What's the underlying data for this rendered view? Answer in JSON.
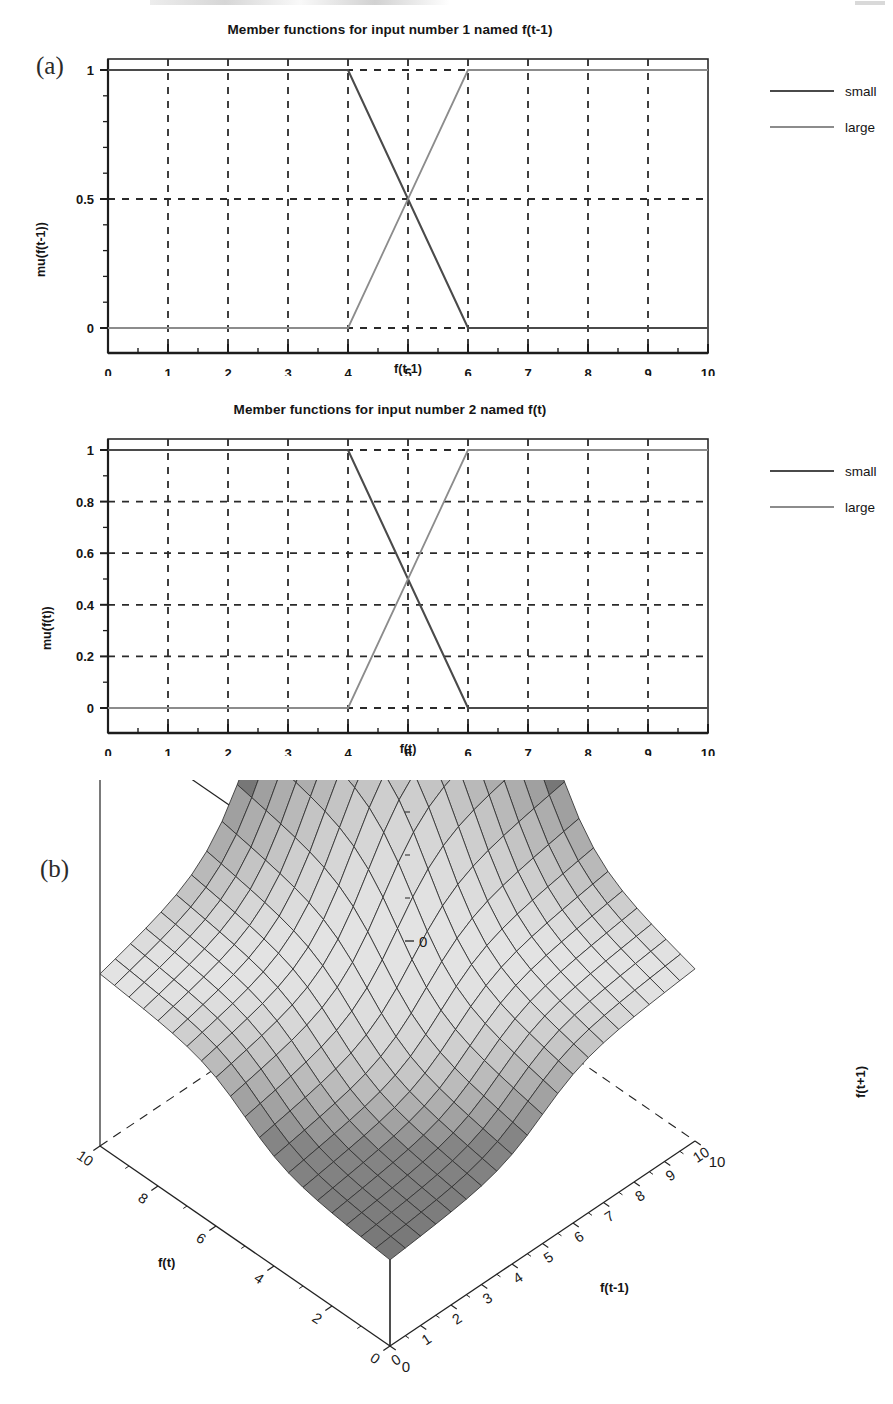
{
  "figure": {
    "panel_a_letter": "(a)",
    "panel_b_letter": "(b)"
  },
  "chart_data": [
    {
      "type": "line",
      "panel": "(a)",
      "title": "Member functions for input number 1 named f(t-1)",
      "xlabel": "f(t-1)",
      "ylabel": "mu(f(t-1))",
      "xlim": [
        0,
        10
      ],
      "ylim": [
        0,
        1
      ],
      "xticks": [
        "0",
        "1",
        "2",
        "3",
        "4",
        "5",
        "6",
        "7",
        "8",
        "9",
        "10"
      ],
      "yticks": [
        "0",
        "0.5",
        "1"
      ],
      "grid": true,
      "grid_style": "dashed",
      "legend_position": "right-outside",
      "series": [
        {
          "name": "small",
          "color": "#4a4a4a",
          "x": [
            0,
            4,
            6,
            10
          ],
          "y": [
            1,
            1,
            0,
            0
          ]
        },
        {
          "name": "large",
          "color": "#8c8c8c",
          "x": [
            0,
            4,
            6,
            10
          ],
          "y": [
            0,
            0,
            1,
            1
          ]
        }
      ],
      "crossing_point": {
        "x": 5,
        "y": 0.5
      }
    },
    {
      "type": "line",
      "panel": "(a)",
      "title": "Member functions for input number 2 named f(t)",
      "xlabel": "f(t)",
      "ylabel": "mu(f(t))",
      "xlim": [
        0,
        10
      ],
      "ylim": [
        0,
        1
      ],
      "xticks": [
        "0",
        "1",
        "2",
        "3",
        "4",
        "5",
        "6",
        "7",
        "8",
        "9",
        "10"
      ],
      "yticks": [
        "0",
        "0.2",
        "0.4",
        "0.6",
        "0.8",
        "1"
      ],
      "grid": true,
      "grid_style": "dashed",
      "legend_position": "right-outside",
      "series": [
        {
          "name": "small",
          "color": "#4a4a4a",
          "x": [
            0,
            4,
            6,
            10
          ],
          "y": [
            1,
            1,
            0,
            0
          ]
        },
        {
          "name": "large",
          "color": "#8c8c8c",
          "x": [
            0,
            4,
            6,
            10
          ],
          "y": [
            0,
            0,
            1,
            1
          ]
        }
      ],
      "crossing_point": {
        "x": 5,
        "y": 0.5
      }
    },
    {
      "type": "surface",
      "panel": "(b)",
      "title": "",
      "xlabel": "f(t-1)",
      "ylabel": "f(t)",
      "zlabel": "f(t+1)",
      "xlim": [
        0,
        10
      ],
      "ylim": [
        0,
        10
      ],
      "zlim": [
        0,
        20
      ],
      "xticks": [
        "0",
        "1",
        "2",
        "3",
        "4",
        "5",
        "6",
        "7",
        "8",
        "9",
        "10"
      ],
      "yticks": [
        "0",
        "2",
        "4",
        "6",
        "8",
        "10"
      ],
      "zticks": [
        "0",
        "10",
        "20"
      ],
      "grid_n": 20,
      "colormap": "grayscale",
      "description": "Fuzzy inference control surface rising from low f(t+1) at small f(t-1) and f(t) toward a maximum near f(t-1)=10, f(t)=10",
      "z_corners": {
        "x0_y0": 4.0,
        "x10_y0": 8.0,
        "x0_y10": 8.0,
        "x10_y10": 20.0
      }
    }
  ],
  "chart_a": {
    "title": "Member functions for input number 1 named f(t-1)",
    "xlabel": "f(t-1)",
    "ylabel": "mu(f(t-1))",
    "xticks": [
      "0",
      "1",
      "2",
      "3",
      "4",
      "5",
      "6",
      "7",
      "8",
      "9",
      "10"
    ],
    "yticks": [
      "0",
      "0.5",
      "1"
    ],
    "legend": [
      {
        "label": "small",
        "color": "#4a4a4a"
      },
      {
        "label": "large",
        "color": "#8c8c8c"
      }
    ]
  },
  "chart_b": {
    "title": "Member functions for input number 2 named f(t)",
    "xlabel": "f(t)",
    "ylabel": "mu(f(t))",
    "xticks": [
      "0",
      "1",
      "2",
      "3",
      "4",
      "5",
      "6",
      "7",
      "8",
      "9",
      "10"
    ],
    "yticks": [
      "0",
      "0.2",
      "0.4",
      "0.6",
      "0.8",
      "1"
    ],
    "legend": [
      {
        "label": "small",
        "color": "#4a4a4a"
      },
      {
        "label": "large",
        "color": "#8c8c8c"
      }
    ]
  },
  "surface": {
    "xlabel": "f(t-1)",
    "ylabel": "f(t)",
    "zlabel": "f(t+1)",
    "xticks": [
      "0",
      "1",
      "2",
      "3",
      "4",
      "5",
      "6",
      "7",
      "8",
      "9",
      "10"
    ],
    "yticks": [
      "0",
      "2",
      "4",
      "6",
      "8",
      "10"
    ],
    "zticks": [
      "0",
      "10",
      "20"
    ]
  }
}
